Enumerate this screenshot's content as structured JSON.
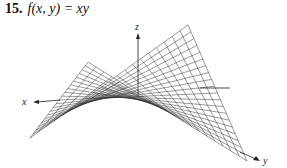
{
  "problem": {
    "number": "15.",
    "function": "f(x, y) = xy"
  },
  "figure": {
    "type": "saddle-surface-wireframe",
    "axes": {
      "x_label": "x",
      "y_label": "y",
      "z_label": "z"
    },
    "grid_lines_per_direction": 21,
    "colors": {
      "mesh": "#333333",
      "axis": "#222222",
      "background": "#ffffff"
    }
  }
}
